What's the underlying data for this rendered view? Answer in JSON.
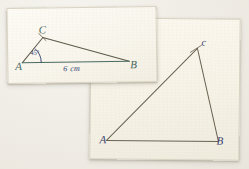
{
  "scene": {
    "background_color": "#efece5",
    "description": "Two photographed paper cards with hand-drawn triangles"
  },
  "cards": [
    {
      "id": "card-left",
      "name": "triangle-card-given",
      "paper_color": "#fbf9f2",
      "ink_color": "#4a6b62",
      "accent_color": "#2c3a6b",
      "triangle": {
        "vertices": [
          {
            "label": "A",
            "x": 14,
            "y": 54
          },
          {
            "label": "C",
            "x": 35,
            "y": 29
          },
          {
            "label": "B",
            "x": 121,
            "y": 54
          }
        ],
        "angle_label": "45°",
        "angle_at": "A",
        "side_label": "6 cm",
        "side_between": "AB"
      }
    },
    {
      "id": "card-right",
      "name": "triangle-card-constructed",
      "paper_color": "#f8f5ec",
      "ink_color": "#6b6352",
      "accent_color": "#39406d",
      "triangle": {
        "vertices": [
          {
            "label": "A",
            "x": 16,
            "y": 122
          },
          {
            "label": "c",
            "x": 106,
            "y": 29
          },
          {
            "label": "B",
            "x": 128,
            "y": 122
          }
        ],
        "angle_label": "",
        "side_label": ""
      }
    }
  ]
}
